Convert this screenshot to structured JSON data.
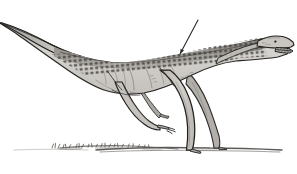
{
  "figure": {
    "kind": "scientific-illustration",
    "caption": "",
    "title": "",
    "background_color": "#ffffff"
  },
  "palette": {
    "ink": "#1a1a1a",
    "outline": "#2b2b2b",
    "body_light": "#d8d6d2",
    "body_mid": "#bdbab5",
    "body_shadow": "#a5a19b",
    "dorsal_dark": "#6f6c67",
    "scute_mark": "#3a3835",
    "ground": "#4a4845",
    "ground_tuft": "#5a5855",
    "leader_line": "#2a2a2a",
    "paper": "#ffffff"
  },
  "annotations": {
    "leader_line": {
      "name": "dorsal-scute-pointer",
      "label": "",
      "from_x": 198,
      "from_y": 20,
      "to_x": 180,
      "to_y": 54
    }
  },
  "anatomy": {
    "parts": [
      {
        "id": "tail",
        "label": "tail"
      },
      {
        "id": "torso",
        "label": "torso"
      },
      {
        "id": "dorsal-scutes",
        "label": "dorsal scute row"
      },
      {
        "id": "neck",
        "label": "neck"
      },
      {
        "id": "head",
        "label": "head"
      },
      {
        "id": "open-jaw",
        "label": "open jaw with teeth"
      },
      {
        "id": "eye",
        "label": "eye"
      },
      {
        "id": "forelimb-near",
        "label": "near forelimb with manus"
      },
      {
        "id": "forelimb-far",
        "label": "far forelimb"
      },
      {
        "id": "hindlimb-near",
        "label": "near hind limb"
      },
      {
        "id": "hindlimb-far",
        "label": "far hind limb"
      },
      {
        "id": "ground-line",
        "label": "ground line"
      },
      {
        "id": "vegetation",
        "label": "ground vegetation tufts"
      }
    ]
  },
  "canvas": {
    "width": 297,
    "height": 174
  }
}
